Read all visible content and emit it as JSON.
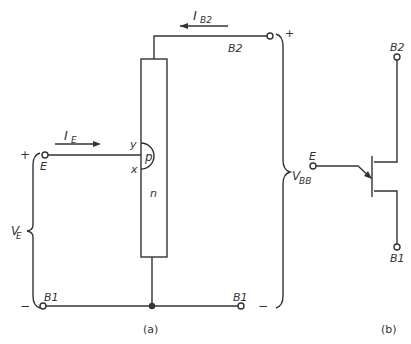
{
  "figure_a": {
    "caption": "(a)",
    "labels": {
      "ib2": "I",
      "ib2_sub": "B2",
      "ie": "I",
      "ie_sub": "E",
      "b2_terminal": "B2",
      "e_terminal": "E",
      "b1_left_terminal": "B1",
      "b1_right_terminal": "B1",
      "y_point": "y",
      "x_point": "x",
      "p_region": "p",
      "n_region": "n",
      "vbb": "V",
      "vbb_sub": "BB",
      "ve": "V",
      "ve_sub": "E",
      "plus_left": "+",
      "minus_left": "−",
      "plus_right": "+",
      "minus_right": "−"
    }
  },
  "figure_b": {
    "caption": "(b)",
    "labels": {
      "b2_terminal": "B2",
      "e_terminal": "E",
      "b1_terminal": "B1"
    }
  },
  "colors": {
    "line": "#333333",
    "background": "#ffffff"
  }
}
